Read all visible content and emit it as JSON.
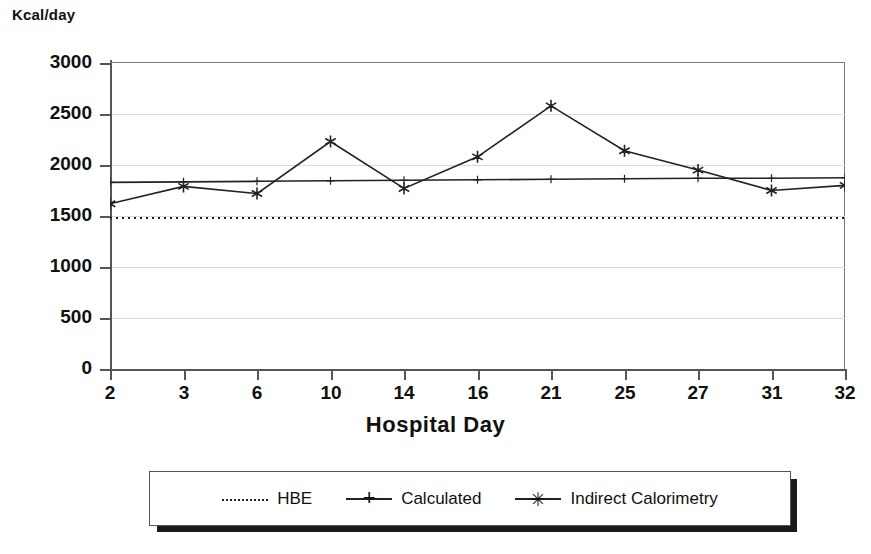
{
  "chart_data": {
    "type": "line",
    "title": "",
    "xlabel": "Hospital Day",
    "ylabel": "Kcal/day",
    "categories": [
      "2",
      "3",
      "6",
      "10",
      "14",
      "16",
      "21",
      "25",
      "27",
      "31",
      "32"
    ],
    "ylim": [
      0,
      3000
    ],
    "yticks": [
      0,
      500,
      1000,
      1500,
      2000,
      2500,
      3000
    ],
    "ytick_labels": [
      "0",
      "500",
      "1000",
      "1500",
      "2000",
      "2500",
      "3000"
    ],
    "grid": true,
    "legend_position": "bottom",
    "series": [
      {
        "name": "HBE",
        "style": "dotted",
        "marker": "none",
        "color": "#222222",
        "values": [
          1480,
          1480,
          1480,
          1480,
          1480,
          1480,
          1480,
          1480,
          1480,
          1480,
          1480
        ]
      },
      {
        "name": "Calculated",
        "style": "solid",
        "marker": "plus",
        "color": "#222222",
        "values": [
          1830,
          1835,
          1840,
          1845,
          1850,
          1855,
          1860,
          1865,
          1870,
          1870,
          1875
        ]
      },
      {
        "name": "Indirect Calorimetry",
        "style": "solid",
        "marker": "star",
        "color": "#222222",
        "values": [
          1620,
          1790,
          1720,
          2230,
          1770,
          2080,
          2580,
          2140,
          1950,
          1750,
          1800
        ]
      }
    ]
  },
  "legend": {
    "items": [
      {
        "label": "HBE",
        "marker": "dotted-line-icon"
      },
      {
        "label": "Calculated",
        "marker": "plus-marker-icon"
      },
      {
        "label": "Indirect Calorimetry",
        "marker": "star-marker-icon"
      }
    ]
  },
  "markers": {
    "plus": "+",
    "star": "✳"
  }
}
